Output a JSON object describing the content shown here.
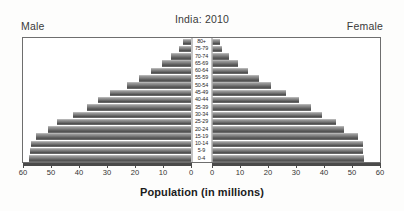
{
  "chart_data": {
    "type": "bar",
    "subtype": "population-pyramid",
    "title": "India: 2010",
    "xlabel": "Population (in millions)",
    "ylabel": "",
    "grid": false,
    "legend_position": "top-corners",
    "left_header": "Male",
    "right_header": "Female",
    "axis_max": 60,
    "xticks": [
      60,
      50,
      40,
      30,
      20,
      10,
      0
    ],
    "xticks_right": [
      0,
      10,
      20,
      30,
      40,
      50,
      60
    ],
    "categories": [
      "80+",
      "75-79",
      "70-74",
      "65-69",
      "60-64",
      "55-59",
      "50-54",
      "45-49",
      "40-44",
      "35-39",
      "30-34",
      "25-29",
      "20-24",
      "15-19",
      "10-14",
      "5-9",
      "0-4"
    ],
    "series": [
      {
        "name": "Male",
        "values": [
          3.0,
          4.2,
          7.0,
          10.2,
          14.2,
          18.4,
          23.0,
          28.8,
          33.2,
          37.0,
          42.2,
          48.0,
          51.2,
          55.2,
          57.2,
          57.4,
          58.0
        ]
      },
      {
        "name": "Female",
        "values": [
          3.0,
          3.6,
          6.2,
          9.2,
          13.0,
          16.8,
          21.2,
          26.6,
          31.0,
          35.2,
          39.2,
          44.2,
          47.2,
          52.0,
          53.8,
          53.8,
          54.2
        ]
      }
    ],
    "colors": {
      "bar_light": "#9c9c9c",
      "bar_dark": "#4f4f4f",
      "frame": "#6e6e6e",
      "axis": "#4a4a4a",
      "text": "#333333",
      "background": "#ffffff"
    }
  }
}
